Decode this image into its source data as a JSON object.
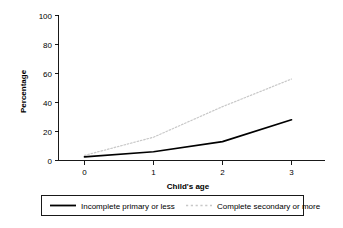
{
  "chart_data": {
    "type": "line",
    "title": "",
    "xlabel": "Child's age",
    "ylabel": "Percentage",
    "x": [
      0,
      1,
      2,
      3
    ],
    "xticks": [
      "0",
      "1",
      "2",
      "3"
    ],
    "yticks": [
      "0",
      "20",
      "40",
      "60",
      "80",
      "100"
    ],
    "xlim": [
      -0.35,
      3.45
    ],
    "ylim": [
      0,
      100
    ],
    "grid": false,
    "legend_position": "bottom",
    "series": [
      {
        "name": "Incomplete primary or less",
        "values": [
          2.5,
          6,
          13,
          28
        ],
        "color": "#000000",
        "style": "solid"
      },
      {
        "name": "Complete secondary or more",
        "values": [
          3.5,
          16,
          37,
          56
        ],
        "color": "#c8c8c8",
        "style": "dotted"
      }
    ]
  },
  "axes": {
    "y_title": "Percentage",
    "x_title": "Child's age",
    "y_tick_0": "0",
    "y_tick_20": "20",
    "y_tick_40": "40",
    "y_tick_60": "60",
    "y_tick_80": "80",
    "y_tick_100": "100",
    "x_tick_0": "0",
    "x_tick_1": "1",
    "x_tick_2": "2",
    "x_tick_3": "3"
  },
  "legend": {
    "items": [
      {
        "label": "Incomplete primary or less",
        "color": "#000000",
        "style": "solid"
      },
      {
        "label": "Complete secondary or more",
        "color": "#c8c8c8",
        "style": "dotted"
      }
    ]
  }
}
